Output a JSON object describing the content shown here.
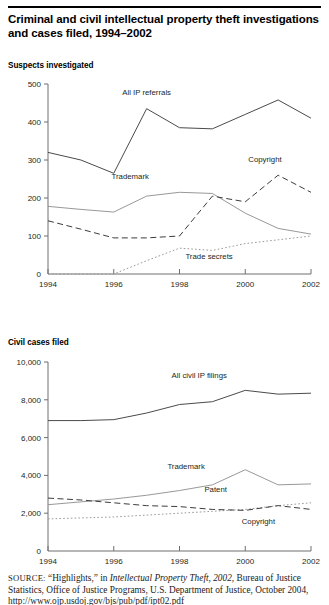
{
  "figure": {
    "title": "Criminal and civil intellectual property theft investigations and cases filed, 1994–2002"
  },
  "source": {
    "label": "SOURCE:",
    "text_1": " “Highlights,” in ",
    "italic_1": "Intellectual Property Theft, 2002",
    "text_2": ", Bureau of Justice Statistics, Office of Justice Programs, U.S. Department of",
    "text_3": "Justice, October 2004, http://www.ojp.usdoj.gov/bjs/pub/pdf/ipt02.pdf"
  },
  "chart_data": [
    {
      "id": "suspects-investigated",
      "type": "line",
      "title": "Suspects investigated",
      "xlabel": "",
      "ylabel": "",
      "x": [
        1994,
        1995,
        1996,
        1997,
        1998,
        1999,
        2000,
        2001,
        2002
      ],
      "xticks": [
        1994,
        1996,
        1998,
        2000,
        2002
      ],
      "xticklabels": [
        "1994",
        "1996",
        "1998",
        "2000",
        "2002"
      ],
      "yticks": [
        0,
        100,
        200,
        300,
        400,
        500
      ],
      "yticklabels": [
        "0",
        "100",
        "200",
        "300",
        "400",
        "500"
      ],
      "ylim": [
        0,
        500
      ],
      "xlim": [
        1994,
        2002
      ],
      "grid": false,
      "legend_position": "inline-annotations",
      "series": [
        {
          "name": "All IP referrals",
          "style": "solid-dark",
          "label_x": 1997.0,
          "label_y": 470,
          "values": [
            320,
            300,
            265,
            435,
            385,
            382,
            420,
            458,
            410
          ]
        },
        {
          "name": "Trademark",
          "style": "solid-light",
          "label_x": 1996.5,
          "label_y": 250,
          "values": [
            178,
            170,
            163,
            205,
            215,
            212,
            160,
            120,
            105
          ]
        },
        {
          "name": "Copyright",
          "style": "dashed",
          "label_x": 2000.6,
          "label_y": 295,
          "values": [
            140,
            118,
            95,
            95,
            100,
            205,
            190,
            260,
            215
          ]
        },
        {
          "name": "Trade secrets",
          "style": "dotted",
          "label_x": 1998.9,
          "label_y": 40,
          "values": [
            0,
            0,
            0,
            35,
            68,
            62,
            80,
            90,
            100
          ]
        }
      ]
    },
    {
      "id": "civil-cases-filed",
      "type": "line",
      "title": "Civil cases filed",
      "xlabel": "",
      "ylabel": "",
      "x": [
        1994,
        1995,
        1996,
        1997,
        1998,
        1999,
        2000,
        2001,
        2002
      ],
      "xticks": [
        1994,
        1996,
        1998,
        2000,
        2002
      ],
      "xticklabels": [
        "1994",
        "1996",
        "1998",
        "2000",
        "2002"
      ],
      "yticks": [
        0,
        2000,
        4000,
        6000,
        8000,
        10000
      ],
      "yticklabels": [
        "0",
        "2,000",
        "4,000",
        "6,000",
        "8,000",
        "10,000"
      ],
      "ylim": [
        0,
        10000
      ],
      "xlim": [
        1994,
        2002
      ],
      "grid": false,
      "legend_position": "inline-annotations",
      "series": [
        {
          "name": "All civil IP filings",
          "style": "solid-dark",
          "label_x": 1998.6,
          "label_y": 9150,
          "values": [
            6900,
            6900,
            6950,
            7300,
            7750,
            7900,
            8500,
            8300,
            8350
          ]
        },
        {
          "name": "Trademark",
          "style": "solid-light",
          "label_x": 1998.2,
          "label_y": 4350,
          "values": [
            2450,
            2600,
            2750,
            2950,
            3200,
            3500,
            4300,
            3500,
            3550
          ]
        },
        {
          "name": "Patent",
          "style": "dotted",
          "label_x": 1999.1,
          "label_y": 3100,
          "values": [
            1700,
            1750,
            1800,
            1900,
            2000,
            2100,
            2200,
            2400,
            2550
          ]
        },
        {
          "name": "Copyright",
          "style": "dashed",
          "label_x": 2000.4,
          "label_y": 1450,
          "values": [
            2800,
            2700,
            2550,
            2400,
            2350,
            2200,
            2150,
            2400,
            2200
          ]
        }
      ]
    }
  ]
}
